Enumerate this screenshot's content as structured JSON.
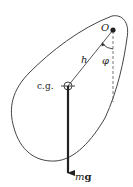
{
  "diagram": {
    "type": "physical-pendulum",
    "labels": {
      "pivot": "O",
      "distance": "h",
      "angle": "φ",
      "center_of_gravity": "c.g.",
      "force_m": "m",
      "force_g": "g"
    },
    "colors": {
      "stroke": "#333333",
      "dashed": "#777777",
      "text": "#222222",
      "background": "#ffffff"
    }
  }
}
